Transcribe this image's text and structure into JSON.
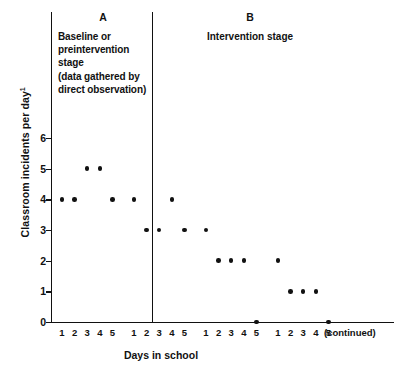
{
  "chart_data": {
    "type": "scatter",
    "title": "",
    "xlabel": "Days in school",
    "ylabel": "Classroom incidents per day",
    "ylabel_superscript": "1",
    "ylim": [
      0,
      6
    ],
    "yticks": [
      0,
      1,
      2,
      3,
      4,
      5,
      6
    ],
    "grid": false,
    "legend": null,
    "x_groups": [
      {
        "index": 0,
        "ticks": [
          "1",
          "2",
          "3",
          "4",
          "5"
        ]
      },
      {
        "index": 1,
        "ticks": [
          "1",
          "2",
          "3",
          "4",
          "5"
        ]
      },
      {
        "index": 2,
        "ticks": [
          "1",
          "2",
          "3",
          "4",
          "5"
        ]
      },
      {
        "index": 3,
        "ticks": [
          "1",
          "2",
          "3",
          "4",
          "5"
        ]
      }
    ],
    "x_axis_suffix": "(continued)",
    "points": [
      {
        "group": 0,
        "day": 1,
        "value": 4
      },
      {
        "group": 0,
        "day": 2,
        "value": 4
      },
      {
        "group": 0,
        "day": 3,
        "value": 5
      },
      {
        "group": 0,
        "day": 4,
        "value": 5
      },
      {
        "group": 0,
        "day": 5,
        "value": 4
      },
      {
        "group": 1,
        "day": 1,
        "value": 4
      },
      {
        "group": 1,
        "day": 2,
        "value": 3
      },
      {
        "group": 1,
        "day": 3,
        "value": 3
      },
      {
        "group": 1,
        "day": 4,
        "value": 4
      },
      {
        "group": 1,
        "day": 5,
        "value": 3
      },
      {
        "group": 2,
        "day": 1,
        "value": 3
      },
      {
        "group": 2,
        "day": 2,
        "value": 2
      },
      {
        "group": 2,
        "day": 3,
        "value": 2
      },
      {
        "group": 2,
        "day": 4,
        "value": 2
      },
      {
        "group": 2,
        "day": 5,
        "value": 0
      },
      {
        "group": 3,
        "day": 1,
        "value": 2
      },
      {
        "group": 3,
        "day": 2,
        "value": 1
      },
      {
        "group": 3,
        "day": 3,
        "value": 1
      },
      {
        "group": 3,
        "day": 4,
        "value": 1
      },
      {
        "group": 3,
        "day": 5,
        "value": 0
      }
    ],
    "phase_divider": {
      "after_group": 1,
      "after_day": 4
    },
    "annotations": {
      "stage_a": {
        "letter": "A",
        "lines": [
          "Baseline or",
          "preintervention",
          "stage",
          "(data gathered by",
          "direct observation)"
        ]
      },
      "stage_b": {
        "letter": "B",
        "lines": [
          "Intervention stage"
        ]
      }
    },
    "colors": {
      "point": "#111111",
      "axis": "#111111",
      "background": "#ffffff"
    }
  }
}
